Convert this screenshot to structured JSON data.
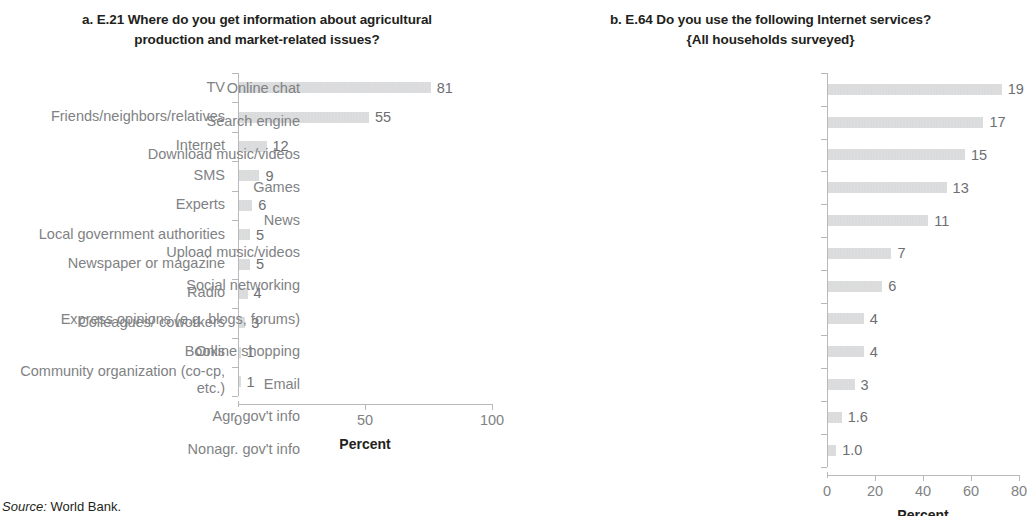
{
  "source_note": {
    "prefix": "Source:",
    "text": "World Bank."
  },
  "chart_data": [
    {
      "type": "bar",
      "orientation": "horizontal",
      "panel_label": "a.",
      "title": "a. E.21 Where do you get information about agricultural production and market-related issues?",
      "title_line1": "a. E.21 Where do you get information about agricultural",
      "title_line2": "production and market-related issues?",
      "xlabel": "Percent",
      "ylabel": "",
      "xlim": [
        0,
        100
      ],
      "xticks": [
        0,
        50,
        100
      ],
      "xtick_labels": [
        "0",
        "50",
        "100"
      ],
      "grid": false,
      "legend": "none",
      "bar_color": "#c9cacc",
      "categories": [
        "TV",
        "Friends/neighbors/relatives",
        "Internet",
        "SMS",
        "Experts",
        "Local government authorities",
        "Newspaper or magazine",
        "Radio",
        "Colleagues/ coworkers",
        "Books",
        "Community organization (co-cp, etc.)"
      ],
      "values": [
        81,
        55,
        12,
        9,
        6,
        5,
        5,
        4,
        3,
        1,
        1
      ],
      "value_labels": [
        "81",
        "55",
        "12",
        "9",
        "6",
        "5",
        "5",
        "4",
        "3",
        "1",
        "1"
      ]
    },
    {
      "type": "bar",
      "orientation": "horizontal",
      "panel_label": "b.",
      "title": "b. E.64 Do you use the following Internet services? {All households surveyed}",
      "title_line1": "b. E.64 Do you use the following Internet services?",
      "title_line2": "{All households surveyed}",
      "xlabel": "Percent",
      "ylabel": "",
      "xlim": [
        0,
        80
      ],
      "xticks": [
        0,
        20,
        40,
        60,
        80
      ],
      "xtick_labels": [
        "0",
        "20",
        "40",
        "60",
        "80"
      ],
      "grid": false,
      "legend": "none",
      "bar_color": "#c9cacc",
      "categories": [
        "Online chat",
        "Search engine",
        "Download music/videos",
        "Games",
        "News",
        "Upload music/videos",
        "Social networking",
        "Express opinions (e.g. blogs, forums)",
        "Online shopping",
        "Email",
        "Agr. gov't info",
        "Nonagr. gov't info"
      ],
      "values": [
        19,
        17,
        15,
        13,
        11,
        7,
        6,
        4,
        4,
        3,
        1.6,
        1.0
      ],
      "value_labels": [
        "19",
        "17",
        "15",
        "13",
        "11",
        "7",
        "6",
        "4",
        "4",
        "3",
        "1.6",
        "1.0"
      ]
    }
  ]
}
